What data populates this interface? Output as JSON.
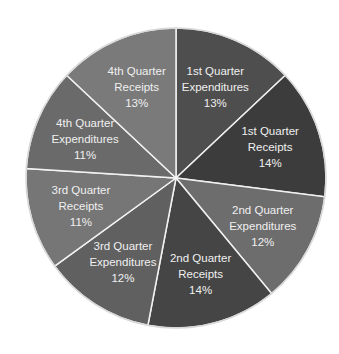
{
  "chart_data": {
    "type": "pie",
    "title": "",
    "start": "top",
    "direction": "clockwise",
    "slices": [
      {
        "label_lines": [
          "1st Quarter",
          "Expenditures"
        ],
        "pct_label": "13%",
        "value": 13,
        "color": "#4e4e4e"
      },
      {
        "label_lines": [
          "1st Quarter",
          "Receipts"
        ],
        "pct_label": "14%",
        "value": 14,
        "color": "#3c3c3c"
      },
      {
        "label_lines": [
          "2nd Quarter",
          "Expenditures"
        ],
        "pct_label": "12%",
        "value": 12,
        "color": "#6d6d6d"
      },
      {
        "label_lines": [
          "2nd Quarter",
          "Receipts"
        ],
        "pct_label": "14%",
        "value": 14,
        "color": "#454545"
      },
      {
        "label_lines": [
          "3rd Quarter",
          "Expenditures"
        ],
        "pct_label": "12%",
        "value": 12,
        "color": "#606060"
      },
      {
        "label_lines": [
          "3rd Quarter",
          "Receipts"
        ],
        "pct_label": "11%",
        "value": 11,
        "color": "#767676"
      },
      {
        "label_lines": [
          "4th Quarter",
          "Expenditures"
        ],
        "pct_label": "11%",
        "value": 11,
        "color": "#6a6a6a"
      },
      {
        "label_lines": [
          "4th Quarter",
          "Receipts"
        ],
        "pct_label": "13%",
        "value": 13,
        "color": "#7a7a7a"
      }
    ],
    "legend": "none"
  }
}
